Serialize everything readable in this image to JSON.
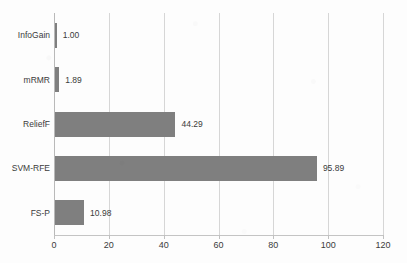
{
  "chart_data": {
    "type": "bar",
    "orientation": "horizontal",
    "title": "",
    "subtitle": "",
    "xlabel": "",
    "ylabel": "",
    "categories": [
      "InfoGain",
      "mRMR",
      "ReliefF",
      "SVM-RFE",
      "FS-P"
    ],
    "values": [
      1.0,
      1.89,
      44.29,
      95.89,
      10.98
    ],
    "value_labels": [
      "1.00",
      "1.89",
      "44.29",
      "95.89",
      "10.98"
    ],
    "xlim": [
      0,
      120
    ],
    "xticks": [
      0,
      20,
      40,
      60,
      80,
      100,
      120
    ],
    "xtick_labels": [
      "0",
      "20",
      "40",
      "60",
      "80",
      "100",
      "120"
    ],
    "grid": {
      "vertical": true,
      "horizontal": false
    },
    "legend": {
      "visible": false,
      "position": "none"
    },
    "series": [
      {
        "name": "",
        "values": [
          1.0,
          1.89,
          44.29,
          95.89,
          10.98
        ]
      }
    ]
  },
  "style": {
    "bar_color": "#7f7f7f",
    "gridline_color": "#d6d6d6",
    "axis_color": "#b9b9b9",
    "text_color": "#3b3b3b",
    "background_color": "#fdfdfd"
  }
}
